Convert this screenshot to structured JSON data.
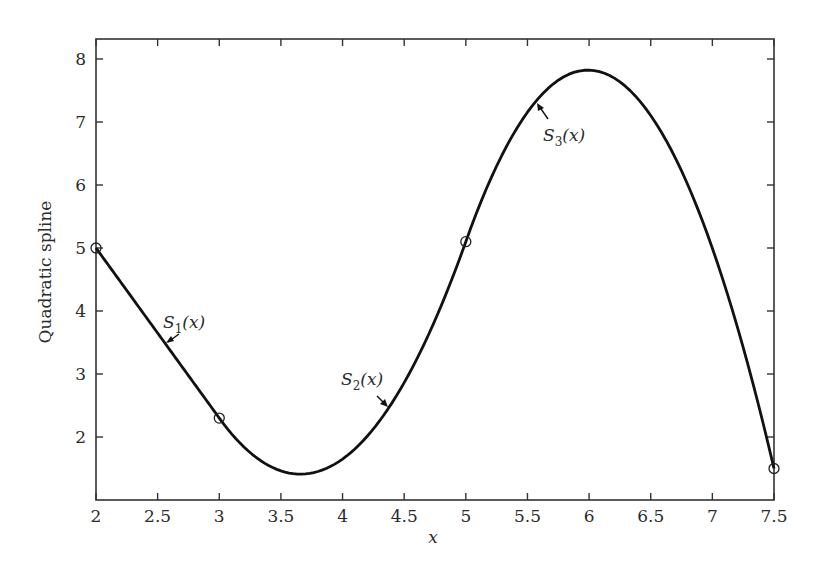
{
  "chart_data": {
    "type": "line",
    "title": "",
    "xlabel": "x",
    "ylabel": "Quadratic spline",
    "xlim": [
      2,
      7.5
    ],
    "ylim": [
      1.1,
      8.3
    ],
    "xticks": [
      2,
      2.5,
      3,
      3.5,
      4,
      4.5,
      5,
      5.5,
      6,
      6.5,
      7,
      7.5
    ],
    "xtick_labels": [
      "2",
      "2.5",
      "3",
      "3.5",
      "4",
      "4.5",
      "5",
      "5.5",
      "6",
      "6.5",
      "7",
      "7.5"
    ],
    "yticks": [
      2,
      3,
      4,
      5,
      6,
      7,
      8
    ],
    "ytick_labels": [
      "2",
      "3",
      "4",
      "5",
      "6",
      "7",
      "8"
    ],
    "grid": false,
    "legend": null,
    "knots": {
      "x": [
        2,
        3,
        5,
        7.5
      ],
      "y": [
        5,
        2.3,
        5.1,
        1.5
      ],
      "marker": "circle-open"
    },
    "series": [
      {
        "name": "S1(x)",
        "interval": [
          2,
          3
        ],
        "form": "5 - 2.7(x-2)",
        "x": [
          2,
          2.5,
          3
        ],
        "y": [
          5,
          3.65,
          2.3
        ]
      },
      {
        "name": "S2(x)",
        "interval": [
          3,
          5
        ],
        "form": "2.3 - 2.7(x-3) + 2.05(x-3)^2",
        "x": [
          3,
          3.5,
          3.66,
          4,
          4.5,
          5
        ],
        "y": [
          2.3,
          1.46,
          1.41,
          1.65,
          2.56,
          5.1
        ]
      },
      {
        "name": "S3(x)",
        "interval": [
          5,
          7.5
        ],
        "form": "5.1 + 5.5(x-5) - 2.776(x-5)^2",
        "x": [
          5,
          5.5,
          6,
          6.5,
          7,
          7.5
        ],
        "y": [
          5.1,
          7.16,
          7.82,
          7.07,
          4.9,
          1.5
        ]
      }
    ],
    "annotations": [
      {
        "text": "S",
        "sub": "1",
        "suffix": "(x)",
        "target": "S1 near x=2.58"
      },
      {
        "text": "S",
        "sub": "2",
        "suffix": "(x)",
        "target": "S2 near x=4.36"
      },
      {
        "text": "S",
        "sub": "3",
        "suffix": "(x)",
        "target": "S3 near x=5.6"
      }
    ],
    "line_color": "#111111",
    "axis_color": "#333333"
  }
}
